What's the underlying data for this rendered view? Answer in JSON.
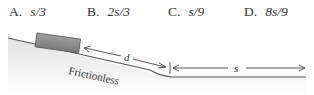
{
  "answer_choices": [
    {
      "letter": "A.",
      "value": "s/3"
    },
    {
      "letter": "B.",
      "value": "2s/3"
    },
    {
      "letter": "C.",
      "value": "s/9"
    },
    {
      "letter": "D.",
      "value": "8s/9"
    }
  ],
  "figure": {
    "incline_label": "Frictionless",
    "distance_on_incline_label": "d",
    "distance_on_flat_label": "s",
    "colors": {
      "block": "#8a8a8a",
      "surface_line": "#555555",
      "ground_shade": "#e6e6e6"
    }
  }
}
